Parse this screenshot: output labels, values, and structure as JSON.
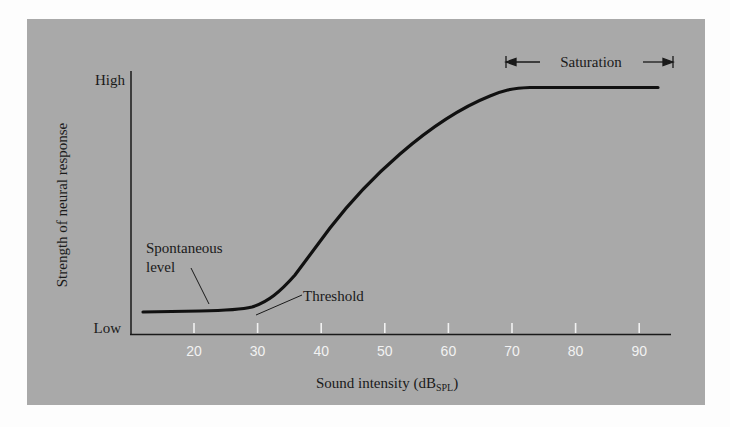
{
  "chart_data": {
    "type": "line",
    "title": "",
    "xlabel": "Sound intensity (dB",
    "xlabel_subscript": "SPL",
    "xlabel_close": ")",
    "ylabel": "Strength of neural response",
    "y_tick_labels": {
      "high": "High",
      "low": "Low"
    },
    "x_ticks": [
      20,
      30,
      40,
      50,
      60,
      70,
      80,
      90
    ],
    "xlim": [
      10,
      95
    ],
    "ylim": [
      0,
      1
    ],
    "grid": false,
    "series": [
      {
        "name": "Neural response",
        "x": [
          12,
          20,
          25,
          28,
          30,
          32,
          35,
          40,
          45,
          50,
          55,
          60,
          65,
          68,
          70,
          75,
          80,
          85,
          90,
          93
        ],
        "y": [
          0.11,
          0.11,
          0.115,
          0.12,
          0.14,
          0.18,
          0.27,
          0.44,
          0.59,
          0.72,
          0.83,
          0.92,
          0.97,
          0.99,
          1.0,
          1.0,
          1.0,
          1.0,
          1.0,
          1.0
        ]
      }
    ],
    "annotations": [
      {
        "text": "Spontaneous",
        "text2": "level",
        "points_to_x": 22
      },
      {
        "text": "Threshold",
        "points_to_x": 30
      },
      {
        "text": "Saturation",
        "range": [
          69,
          94
        ]
      }
    ]
  },
  "colors": {
    "panel": "#a9a9a9",
    "curve": "#111111",
    "tick_label": "#f2f2f2"
  }
}
